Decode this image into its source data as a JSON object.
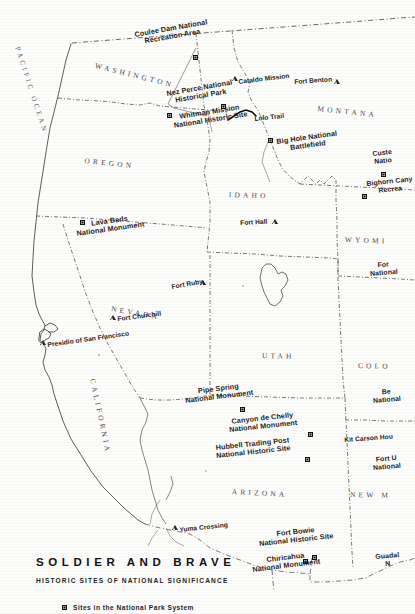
{
  "title_block": {
    "title": "SOLDIER AND BRAVE",
    "subtitle": "HISTORIC SITES OF NATIONAL SIGNIFICANCE"
  },
  "legend": {
    "marker": "square-marker-icon",
    "text": "Sites in the National Park System"
  },
  "ocean_label": "PACIFIC OCEAN",
  "states": [
    {
      "name": "WASHINGTON",
      "x": 96,
      "y": 62,
      "rot": 14
    },
    {
      "name": "OREGON",
      "x": 85,
      "y": 157,
      "rot": 6
    },
    {
      "name": "MONTANA",
      "x": 318,
      "y": 105,
      "rot": 6
    },
    {
      "name": "IDAHO",
      "x": 229,
      "y": 191,
      "rot": 2
    },
    {
      "name": "WYOMI",
      "x": 345,
      "y": 236,
      "rot": 2
    },
    {
      "name": "NEVADA",
      "x": 112,
      "y": 305,
      "rot": 10
    },
    {
      "name": "UTAH",
      "x": 262,
      "y": 352,
      "rot": 1
    },
    {
      "name": "COLO",
      "x": 358,
      "y": 362,
      "rot": 1
    },
    {
      "name": "ARIZONA",
      "x": 232,
      "y": 488,
      "rot": 3
    },
    {
      "name": "NEW  M",
      "x": 350,
      "y": 491,
      "rot": 1
    },
    {
      "name": "CALIFORNIA",
      "x": 96,
      "y": 378,
      "rot": 78
    }
  ],
  "park_sites": [
    {
      "label": "Coulee Dam National\nRecreation Area",
      "x": 134,
      "y": 31,
      "rot": -10,
      "marker_x": 193,
      "marker_y": 55,
      "marker": "square-marker-icon"
    },
    {
      "label": "Nez Perce National\nHistorical Park",
      "x": 166,
      "y": 90,
      "rot": -10,
      "marker_x": 221,
      "marker_y": 104,
      "marker": "square-marker-icon"
    },
    {
      "label": "Whitman Mission\nNational Historic Site",
      "x": 172,
      "y": 114,
      "rot": -9,
      "marker_x": 167,
      "marker_y": 113,
      "marker": "square-marker-icon"
    },
    {
      "label": "Big Hole National\nBattlefield",
      "x": 276,
      "y": 138,
      "rot": -8,
      "marker_x": 268,
      "marker_y": 138,
      "marker": "square-marker-icon"
    },
    {
      "label": "Custe\nNatio",
      "x": 372,
      "y": 150,
      "rot": -6,
      "marker_x": 381,
      "marker_y": 172,
      "marker": "square-marker-icon"
    },
    {
      "label": "Bighorn Cany\nRecrea",
      "x": 366,
      "y": 180,
      "rot": -6,
      "marker_x": 362,
      "marker_y": 194,
      "marker": "square-marker-icon"
    },
    {
      "label": "Lava Beds\nNational Monument",
      "x": 75,
      "y": 222,
      "rot": -8,
      "marker_x": 80,
      "marker_y": 220,
      "marker": "square-marker-icon"
    },
    {
      "label": "For\nNational",
      "x": 369,
      "y": 262,
      "rot": -5,
      "marker_x": 0,
      "marker_y": 0,
      "marker": "none"
    },
    {
      "label": "Pipe Spring\nNational Monument",
      "x": 184,
      "y": 389,
      "rot": -7,
      "marker_x": 240,
      "marker_y": 407,
      "marker": "square-marker-icon"
    },
    {
      "label": "Be\nNational",
      "x": 372,
      "y": 389,
      "rot": -5,
      "marker_x": 0,
      "marker_y": 0,
      "marker": "none"
    },
    {
      "label": "Canyon de Chelly\nNational Monument",
      "x": 228,
      "y": 418,
      "rot": -6,
      "marker_x": 308,
      "marker_y": 432,
      "marker": "square-marker-icon"
    },
    {
      "label": "Hubbell Trading Post\nNational Historic Site",
      "x": 215,
      "y": 444,
      "rot": -6,
      "marker_x": 305,
      "marker_y": 457,
      "marker": "square-marker-icon"
    },
    {
      "label": "Fort U\nNational",
      "x": 372,
      "y": 456,
      "rot": -5,
      "marker_x": 0,
      "marker_y": 0,
      "marker": "none"
    },
    {
      "label": "Fort Bowie\nNational Historic Site",
      "x": 258,
      "y": 532,
      "rot": -6,
      "marker_x": 312,
      "marker_y": 555,
      "marker": "square-marker-icon"
    },
    {
      "label": "Chiricahua\nNational Monument",
      "x": 251,
      "y": 558,
      "rot": -7,
      "marker_x": 303,
      "marker_y": 559,
      "marker": "square-marker-icon"
    },
    {
      "label": "Guadal\nN",
      "x": 375,
      "y": 553,
      "rot": -5,
      "marker_x": 0,
      "marker_y": 0,
      "marker": "none"
    }
  ],
  "point_sites": [
    {
      "label": "Cataldo Mission",
      "x": 238,
      "y": 78,
      "rot": -7,
      "marker_x": 232,
      "marker_y": 76,
      "marker": "triangle-marker-icon"
    },
    {
      "label": "Fort Benton",
      "x": 294,
      "y": 78,
      "rot": -4,
      "marker_x": 334,
      "marker_y": 79,
      "marker": "triangle-marker-icon"
    },
    {
      "label": "Lolo Trail",
      "x": 254,
      "y": 115,
      "rot": -6,
      "marker_x": 0,
      "marker_y": 0,
      "marker": "none"
    },
    {
      "label": "Fort Hall",
      "x": 240,
      "y": 219,
      "rot": -3,
      "marker_x": 272,
      "marker_y": 219,
      "marker": "triangle-marker-icon"
    },
    {
      "label": "Fort Ruby",
      "x": 171,
      "y": 283,
      "rot": -10,
      "marker_x": 200,
      "marker_y": 280,
      "marker": "triangle-marker-icon"
    },
    {
      "label": "Fort Churchill",
      "x": 117,
      "y": 315,
      "rot": -7,
      "marker_x": 110,
      "marker_y": 315,
      "marker": "triangle-marker-icon"
    },
    {
      "label": "Presidio of San Francisco",
      "x": 47,
      "y": 341,
      "rot": -8,
      "marker_x": 40,
      "marker_y": 340,
      "marker": "triangle-marker-icon"
    },
    {
      "label": "Kit Carson Hou",
      "x": 344,
      "y": 436,
      "rot": -4,
      "marker_x": 0,
      "marker_y": 0,
      "marker": "none"
    },
    {
      "label": "Yuma Crossing",
      "x": 179,
      "y": 526,
      "rot": -6,
      "marker_x": 172,
      "marker_y": 525,
      "marker": "triangle-marker-icon"
    }
  ],
  "colors": {
    "ink": "#1b1b1b",
    "state_text": "#4a4a4a",
    "paper": "#fdfdfc",
    "coast": "#3a3a3a"
  }
}
